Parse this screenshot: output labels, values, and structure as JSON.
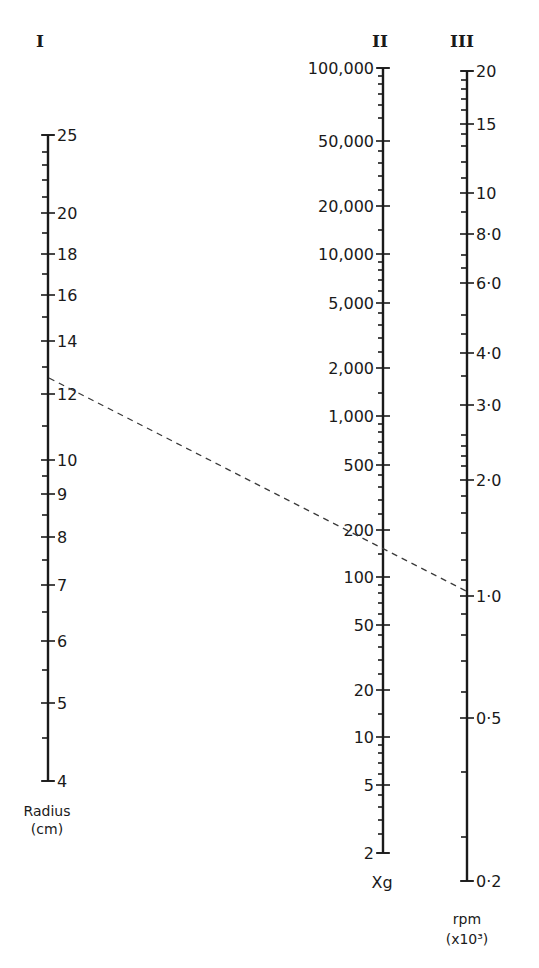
{
  "chart_data": {
    "type": "nomogram",
    "title": "",
    "axes": [
      {
        "id": "I",
        "roman": "I",
        "name": "Radius",
        "unit": "(cm)",
        "x": 48,
        "top": 135,
        "bottom": 781,
        "label_side": "right",
        "major": [
          {
            "value": 25,
            "label": "25",
            "y": 135
          },
          {
            "value": 20,
            "label": "20",
            "y": 213
          },
          {
            "value": 18,
            "label": "18",
            "y": 254
          },
          {
            "value": 16,
            "label": "16",
            "y": 295
          },
          {
            "value": 14,
            "label": "14",
            "y": 341
          },
          {
            "value": 12,
            "label": "12",
            "y": 394
          },
          {
            "value": 10,
            "label": "10",
            "y": 460
          },
          {
            "value": 9,
            "label": "9",
            "y": 494
          },
          {
            "value": 8,
            "label": "8",
            "y": 537
          },
          {
            "value": 7,
            "label": "7",
            "y": 585
          },
          {
            "value": 6,
            "label": "6",
            "y": 641
          },
          {
            "value": 5,
            "label": "5",
            "y": 703
          },
          {
            "value": 4,
            "label": "4",
            "y": 781
          }
        ],
        "minor_y": [
          152,
          165,
          180,
          197,
          233,
          274,
          317,
          367,
          426,
          476,
          515,
          560,
          612,
          670,
          738
        ]
      },
      {
        "id": "II",
        "roman": "II",
        "name": "Xg",
        "unit": "",
        "x": 383,
        "top": 68,
        "bottom": 853,
        "label_side": "left",
        "major": [
          {
            "value": 100000,
            "label": "100,000",
            "y": 68
          },
          {
            "value": 50000,
            "label": "50,000",
            "y": 141
          },
          {
            "value": 20000,
            "label": "20,000",
            "y": 206
          },
          {
            "value": 10000,
            "label": "10,000",
            "y": 254
          },
          {
            "value": 5000,
            "label": "5,000",
            "y": 303
          },
          {
            "value": 2000,
            "label": "2,000",
            "y": 368
          },
          {
            "value": 1000,
            "label": "1,000",
            "y": 416
          },
          {
            "value": 500,
            "label": "500",
            "y": 465
          },
          {
            "value": 200,
            "label": "200",
            "y": 530
          },
          {
            "value": 100,
            "label": "100",
            "y": 577
          },
          {
            "value": 50,
            "label": "50",
            "y": 625
          },
          {
            "value": 20,
            "label": "20",
            "y": 690
          },
          {
            "value": 10,
            "label": "10",
            "y": 737
          },
          {
            "value": 5,
            "label": "5",
            "y": 785
          },
          {
            "value": 2,
            "label": "2",
            "y": 853
          }
        ],
        "minor_y": [
          76,
          84,
          94,
          105,
          118,
          151,
          163,
          176,
          190,
          230,
          262,
          270,
          280,
          291,
          313,
          325,
          338,
          352,
          393,
          424,
          432,
          442,
          453,
          475,
          487,
          500,
          514,
          554,
          585,
          593,
          603,
          614,
          635,
          647,
          660,
          674,
          714,
          745,
          753,
          763,
          774,
          795,
          807,
          820,
          834
        ]
      },
      {
        "id": "III",
        "roman": "III",
        "name": "rpm",
        "unit": "(x10³)",
        "x": 467,
        "top": 71,
        "bottom": 881,
        "label_side": "right",
        "major": [
          {
            "value": 20,
            "label": "20",
            "y": 71
          },
          {
            "value": 15,
            "label": "15",
            "y": 124
          },
          {
            "value": 10,
            "label": "10",
            "y": 193
          },
          {
            "value": 8,
            "label": "8·0",
            "y": 234
          },
          {
            "value": 6,
            "label": "6·0",
            "y": 283
          },
          {
            "value": 4,
            "label": "4·0",
            "y": 353
          },
          {
            "value": 3,
            "label": "3·0",
            "y": 405
          },
          {
            "value": 2,
            "label": "2·0",
            "y": 480
          },
          {
            "value": 1,
            "label": "1·0",
            "y": 596
          },
          {
            "value": 0.5,
            "label": "0·5",
            "y": 718
          },
          {
            "value": 0.2,
            "label": "0·2",
            "y": 881
          }
        ],
        "minor_y": [
          80,
          89,
          99,
          110,
          134,
          146,
          162,
          178,
          212,
          255,
          268,
          315,
          334,
          376,
          435,
          446,
          456,
          466,
          496,
          513,
          533,
          560,
          580,
          614,
          635,
          661,
          692,
          772,
          837
        ]
      }
    ],
    "example_line": {
      "style": "dashed",
      "from": {
        "axis": "I",
        "value": 12.5,
        "x": 49,
        "y": 378
      },
      "through": {
        "axis": "II",
        "value": 150,
        "x": 383,
        "y": 549
      },
      "to": {
        "axis": "III",
        "value": 1.03,
        "x": 466,
        "y": 591
      }
    }
  },
  "labels": {
    "axis_I_roman": "I",
    "axis_II_roman": "II",
    "axis_III_roman": "III",
    "axis_I_name": "Radius",
    "axis_I_unit": "(cm)",
    "axis_II_name": "Xg",
    "axis_III_name": "rpm",
    "axis_III_unit": "(x10³)"
  }
}
